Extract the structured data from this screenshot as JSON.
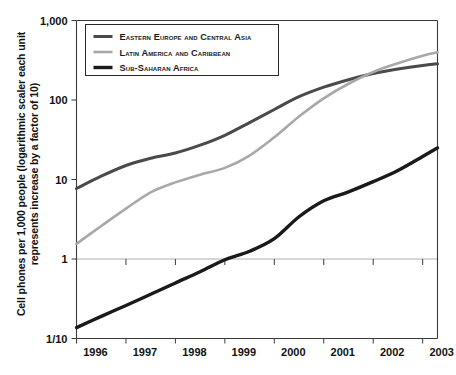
{
  "chart_data": {
    "type": "line",
    "title": "",
    "xlabel": "",
    "ylabel_line1": "Cell phones per 1,000 people (logarithmic scaler each unit",
    "ylabel_line2": "represents increase by a factor of 10)",
    "x_tick_labels": [
      "1996",
      "1997",
      "1998",
      "1999",
      "2000",
      "2001",
      "2002",
      "2003"
    ],
    "y_tick_labels": [
      "1,000",
      "100",
      "10",
      "1",
      "1/10"
    ],
    "y_tick_values": [
      1000,
      100,
      10,
      1,
      0.1
    ],
    "yscale": "log",
    "ylim": [
      0.1,
      1000
    ],
    "xlim": [
      1996,
      2003.3
    ],
    "grid": "horizontal at 1",
    "legend_position": "top-left inside",
    "x": [
      1996,
      1996.5,
      1997,
      1997.5,
      1998,
      1998.5,
      1999,
      1999.5,
      2000,
      2000.5,
      2001,
      2001.5,
      2002,
      2002.5,
      2003,
      2003.3
    ],
    "series": [
      {
        "name": "Eastern Europe and Central Asia",
        "color": "#4a4a4a",
        "values": [
          7.7,
          11.0,
          15.0,
          18.5,
          21.5,
          27.0,
          36.0,
          52.0,
          76.0,
          110.0,
          145.0,
          180.0,
          215.0,
          245.0,
          272.0,
          285.0
        ]
      },
      {
        "name": "Latin America and Caribbean",
        "color": "#a8a8a8",
        "values": [
          1.55,
          2.6,
          4.3,
          6.9,
          9.2,
          11.5,
          14.0,
          20.0,
          34.0,
          62.0,
          105.0,
          160.0,
          225.0,
          290.0,
          360.0,
          400.0
        ]
      },
      {
        "name": "Sub-Saharan Africa",
        "color": "#1a1a1a",
        "values": [
          0.137,
          0.19,
          0.26,
          0.36,
          0.5,
          0.69,
          0.98,
          1.25,
          1.8,
          3.4,
          5.4,
          7.0,
          9.4,
          13.0,
          19.5,
          25.0
        ]
      }
    ],
    "legend": [
      {
        "label": "Eastern Europe and Central Asia",
        "color": "#4a4a4a",
        "width": 3.0
      },
      {
        "label": "Latin America and Caribbean",
        "color": "#a8a8a8",
        "width": 2.6
      },
      {
        "label": "Sub-Saharan Africa",
        "color": "#1a1a1a",
        "width": 3.4
      }
    ]
  }
}
